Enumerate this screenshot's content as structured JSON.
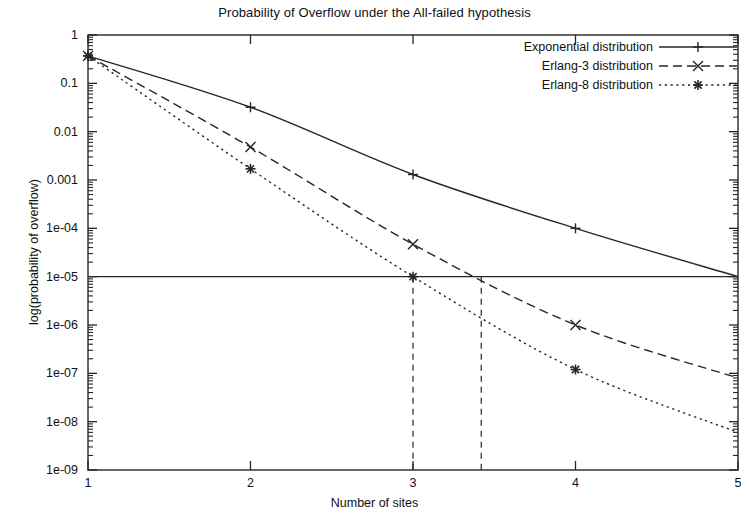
{
  "chart_data": {
    "type": "line",
    "title": "Probability of Overflow under the All-failed hypothesis",
    "xlabel": "Number of sites",
    "ylabel": "log(probability of overflow)",
    "xlim": [
      1,
      5
    ],
    "ylim": [
      1e-09,
      1
    ],
    "yscale": "log",
    "xscale": "linear",
    "grid": false,
    "legend_position": "top-right",
    "x_ticks": [
      "1",
      "2",
      "3",
      "4",
      "5"
    ],
    "x_tick_values": [
      1,
      2,
      3,
      4,
      5
    ],
    "y_ticks": [
      "1",
      "0.1",
      "0.01",
      "0.001",
      "1e-04",
      "1e-05",
      "1e-06",
      "1e-07",
      "1e-08",
      "1e-09"
    ],
    "y_tick_values": [
      1,
      0.1,
      0.01,
      0.001,
      0.0001,
      1e-05,
      1e-06,
      1e-07,
      1e-08,
      1e-09
    ],
    "series": [
      {
        "name": "Exponential distribution",
        "marker": "plus",
        "linestyle": "solid",
        "x": [
          1,
          2,
          3,
          4,
          5
        ],
        "values": [
          0.37,
          0.032,
          0.0013,
          0.0001,
          1e-05
        ]
      },
      {
        "name": "Erlang-3 distribution",
        "marker": "cross",
        "linestyle": "dashed",
        "x": [
          1,
          2,
          3,
          4,
          5
        ],
        "values": [
          0.37,
          0.0048,
          4.7e-05,
          1e-06,
          8e-08
        ]
      },
      {
        "name": "Erlang-8 distribution",
        "marker": "star",
        "linestyle": "dotted",
        "x": [
          1,
          2,
          3,
          4,
          5
        ],
        "values": [
          0.37,
          0.0017,
          1e-05,
          1.2e-07,
          6e-09
        ]
      }
    ],
    "annotations": [
      {
        "name": "threshold-line",
        "type": "hline",
        "y": 1e-05,
        "style": "solid"
      },
      {
        "name": "erlang8-crossing",
        "type": "vline",
        "x": 3,
        "y_top": 1e-05,
        "style": "dashed"
      },
      {
        "name": "erlang3-crossing",
        "type": "vline",
        "x": 3.42,
        "y_top": 1e-05,
        "style": "dashed"
      }
    ]
  },
  "legend": {
    "items": [
      {
        "label": "Exponential distribution"
      },
      {
        "label": "Erlang-3 distribution"
      },
      {
        "label": "Erlang-8 distribution"
      }
    ]
  },
  "colors": {
    "line": "#262626",
    "axis": "#262626",
    "text": "#111111",
    "background": "#ffffff"
  }
}
